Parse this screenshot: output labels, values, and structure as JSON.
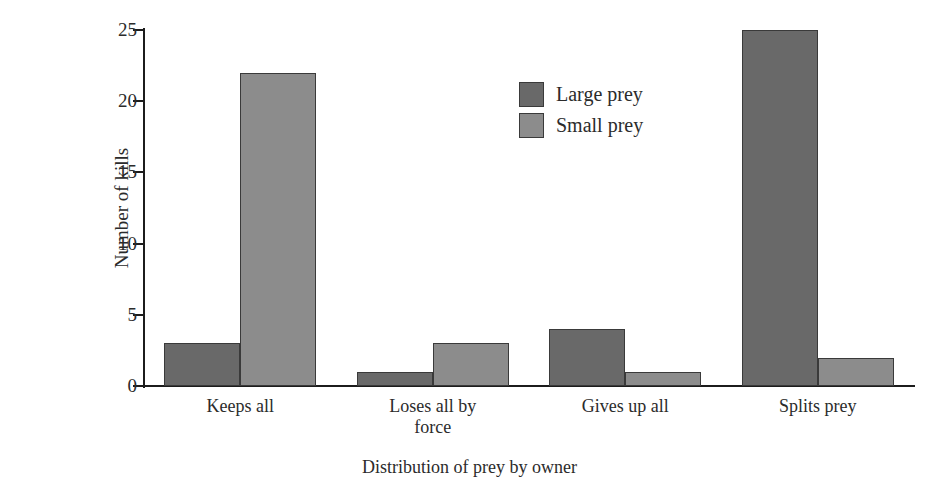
{
  "chart_data": {
    "type": "bar",
    "title": "",
    "xlabel": "Distribution of prey by owner",
    "ylabel": "Number of kills",
    "categories": [
      "Keeps all",
      "Loses all by force",
      "Gives up all",
      "Splits prey"
    ],
    "category_lines": [
      [
        "Keeps all"
      ],
      [
        "Loses all by",
        "force"
      ],
      [
        "Gives up all"
      ],
      [
        "Splits prey"
      ]
    ],
    "series": [
      {
        "name": "Large prey",
        "color": "#696969",
        "values": [
          3,
          1,
          4,
          25
        ]
      },
      {
        "name": "Small prey",
        "color": "#8c8c8c",
        "values": [
          22,
          3,
          1,
          2
        ]
      }
    ],
    "ylim": [
      0,
      25
    ],
    "yticks": [
      0,
      5,
      10,
      15,
      20,
      25
    ],
    "ytick_labels": [
      "0",
      "5",
      "10",
      "15",
      "20",
      "25"
    ],
    "grid": false,
    "legend_position": "top-center",
    "axis_color": "#1c1c1c",
    "background": "#ffffff"
  }
}
